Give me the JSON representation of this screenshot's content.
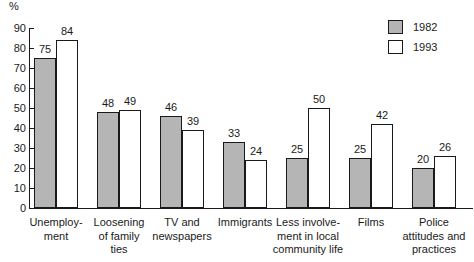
{
  "chart_data": {
    "type": "bar",
    "title": "",
    "xlabel": "",
    "ylabel": "%",
    "ylim": [
      0,
      90
    ],
    "yticks": [
      0,
      10,
      20,
      30,
      40,
      50,
      60,
      70,
      80,
      90
    ],
    "grid": false,
    "legend_position": "top-right",
    "categories": [
      "Unemploy-\nment",
      "Loosening\nof family\nties",
      "TV and\nnewspapers",
      "Immigrants",
      "Less involve-\nment in local\ncommunity life",
      "Films",
      "Police\nattitudes and\npractices"
    ],
    "series": [
      {
        "name": "1982",
        "color": "#b5b5b5",
        "values": [
          75,
          48,
          46,
          33,
          25,
          25,
          20
        ]
      },
      {
        "name": "1993",
        "color": "#ffffff",
        "values": [
          84,
          49,
          39,
          24,
          50,
          42,
          26
        ]
      }
    ]
  },
  "legend": {
    "items": [
      {
        "label": "1982",
        "swatch": "filled-gray"
      },
      {
        "label": "1993",
        "swatch": "outline-white"
      }
    ]
  },
  "axis": {
    "unit_label": "%"
  }
}
